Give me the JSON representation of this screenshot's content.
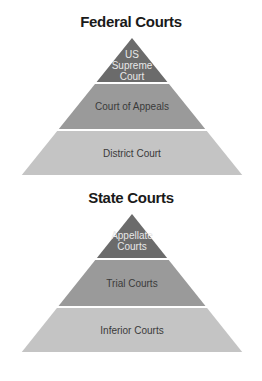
{
  "pyramids": [
    {
      "title": "Federal Courts",
      "tiers": [
        {
          "lines": [
            "US",
            "Supreme",
            "Court"
          ],
          "color": "#6b6b6b",
          "text_color": "#e8e8e8"
        },
        {
          "lines": [
            "Court of Appeals"
          ],
          "color": "#9a9a9a",
          "text_color": "#3a3a3a"
        },
        {
          "lines": [
            "District Court"
          ],
          "color": "#c4c4c4",
          "text_color": "#3a3a3a"
        }
      ]
    },
    {
      "title": "State Courts",
      "tiers": [
        {
          "lines": [
            "Appellate",
            "Courts"
          ],
          "color": "#6b6b6b",
          "text_color": "#e8e8e8"
        },
        {
          "lines": [
            "Trial Courts"
          ],
          "color": "#9a9a9a",
          "text_color": "#3a3a3a"
        },
        {
          "lines": [
            "Inferior Courts"
          ],
          "color": "#c4c4c4",
          "text_color": "#3a3a3a"
        }
      ]
    }
  ]
}
